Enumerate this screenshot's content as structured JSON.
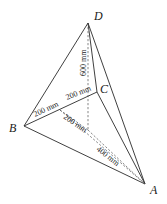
{
  "diagram": {
    "type": "3d-tetrahedron-frame",
    "vertices": {
      "A": {
        "label": "A",
        "x": 145,
        "y": 184
      },
      "B": {
        "label": "B",
        "x": 24,
        "y": 126
      },
      "C": {
        "label": "C",
        "x": 97,
        "y": 92
      },
      "D": {
        "label": "D",
        "x": 88,
        "y": 23
      },
      "O": {
        "label": "",
        "x": 88,
        "y": 130
      }
    },
    "dimensions": {
      "od": "600 mm",
      "oc": "200 mm",
      "bo_upper": "200 mm",
      "bo_lower": "200 mm",
      "oa": "400 mm"
    },
    "colors": {
      "line": "#2a2a2a",
      "dashed": "#555555",
      "text": "#1a1a1a",
      "background": "#ffffff"
    }
  }
}
